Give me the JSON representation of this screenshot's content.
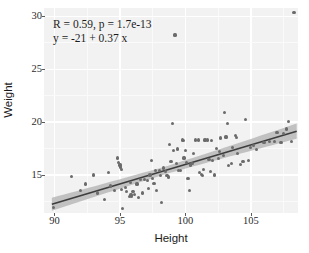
{
  "chart_data": {
    "type": "scatter",
    "title": "",
    "xlabel": "Height",
    "ylabel": "Weight",
    "xlim": [
      89.2,
      108.6
    ],
    "ylim": [
      11.4,
      30.8
    ],
    "xticks": [
      90,
      95,
      100,
      105
    ],
    "xticklabels": [
      "90",
      "95",
      "100",
      "105"
    ],
    "yticks": [
      15,
      20,
      25,
      30
    ],
    "yticklabels": [
      "15",
      "20",
      "25",
      "30"
    ],
    "grid": true,
    "legend": null,
    "annotations": {
      "line1": "R = 0.59,  p =  1.7e-13",
      "line2": "y = -21 + 0.37 x",
      "R": 0.59,
      "p": 1.7e-13,
      "intercept": -21,
      "slope": 0.37
    },
    "fit": {
      "type": "linear-regression",
      "intercept": -21,
      "slope": 0.37,
      "line_color": "#3d3d3d",
      "band_color": "#b4b4b4",
      "band_label": "95% confidence interval",
      "x_start": 89.8,
      "x_end": 108.5,
      "y_start": 12.23,
      "y_end": 19.15,
      "band_halfwidth_start": 0.62,
      "band_halfwidth_mid": 0.26,
      "band_halfwidth_end": 0.72
    },
    "point_color": "#6b6b6b",
    "panel_color": "#f2f2f2",
    "points": [
      [
        89.9,
        11.9
      ],
      [
        91.3,
        14.85
      ],
      [
        92.0,
        13.55
      ],
      [
        92.4,
        14.15
      ],
      [
        93.0,
        15.0
      ],
      [
        93.3,
        13.3
      ],
      [
        93.8,
        12.65
      ],
      [
        94.1,
        15.25
      ],
      [
        94.3,
        13.95
      ],
      [
        94.6,
        13.5
      ],
      [
        94.8,
        16.6
      ],
      [
        94.9,
        16.2
      ],
      [
        95.0,
        15.95
      ],
      [
        95.05,
        15.75
      ],
      [
        95.1,
        15.55
      ],
      [
        95.15,
        13.6
      ],
      [
        95.2,
        11.85
      ],
      [
        95.4,
        13.85
      ],
      [
        95.5,
        13.45
      ],
      [
        95.7,
        12.95
      ],
      [
        95.8,
        14.3
      ],
      [
        95.85,
        13.1
      ],
      [
        95.9,
        12.95
      ],
      [
        96.0,
        13.45
      ],
      [
        96.1,
        13.15
      ],
      [
        96.3,
        14.15
      ],
      [
        96.4,
        12.9
      ],
      [
        96.6,
        14.55
      ],
      [
        96.7,
        13.3
      ],
      [
        96.9,
        14.6
      ],
      [
        97.1,
        14.5
      ],
      [
        97.2,
        13.75
      ],
      [
        97.3,
        15.0
      ],
      [
        97.4,
        16.35
      ],
      [
        97.5,
        14.7
      ],
      [
        97.6,
        14.2
      ],
      [
        97.7,
        15.45
      ],
      [
        97.8,
        13.5
      ],
      [
        98.0,
        15.45
      ],
      [
        98.1,
        14.95
      ],
      [
        98.2,
        12.4
      ],
      [
        98.3,
        15.65
      ],
      [
        98.5,
        15.3
      ],
      [
        98.6,
        14.95
      ],
      [
        98.7,
        14.8
      ],
      [
        98.8,
        17.9
      ],
      [
        98.9,
        16.25
      ],
      [
        99.0,
        19.9
      ],
      [
        99.1,
        17.3
      ],
      [
        99.2,
        28.25
      ],
      [
        99.3,
        16.1
      ],
      [
        99.4,
        17.45
      ],
      [
        99.5,
        15.4
      ],
      [
        99.6,
        15.45
      ],
      [
        99.8,
        18.3
      ],
      [
        99.85,
        18.25
      ],
      [
        99.9,
        16.6
      ],
      [
        100.0,
        17.35
      ],
      [
        100.1,
        16.15
      ],
      [
        100.2,
        14.65
      ],
      [
        100.3,
        13.5
      ],
      [
        100.4,
        15.95
      ],
      [
        100.5,
        16.05
      ],
      [
        100.6,
        17.05
      ],
      [
        100.8,
        18.3
      ],
      [
        101.0,
        18.3
      ],
      [
        101.1,
        15.2
      ],
      [
        101.2,
        15.05
      ],
      [
        101.3,
        14.95
      ],
      [
        101.4,
        15.5
      ],
      [
        101.5,
        18.3
      ],
      [
        101.7,
        18.3
      ],
      [
        101.8,
        16.5
      ],
      [
        101.9,
        15.35
      ],
      [
        102.0,
        18.25
      ],
      [
        102.1,
        16.35
      ],
      [
        102.2,
        15.0
      ],
      [
        102.4,
        17.5
      ],
      [
        102.5,
        16.55
      ],
      [
        102.6,
        17.25
      ],
      [
        102.7,
        18.5
      ],
      [
        102.9,
        16.85
      ],
      [
        103.0,
        20.9
      ],
      [
        103.1,
        18.6
      ],
      [
        103.2,
        19.9
      ],
      [
        103.3,
        15.9
      ],
      [
        103.5,
        16.05
      ],
      [
        103.6,
        17.6
      ],
      [
        103.8,
        18.7
      ],
      [
        103.9,
        18.55
      ],
      [
        104.0,
        17.0
      ],
      [
        104.2,
        16.0
      ],
      [
        104.4,
        16.3
      ],
      [
        104.6,
        20.25
      ],
      [
        104.8,
        16.4
      ],
      [
        105.0,
        17.6
      ],
      [
        105.2,
        17.75
      ],
      [
        105.4,
        17.4
      ],
      [
        106.0,
        18.05
      ],
      [
        106.4,
        18.15
      ],
      [
        106.8,
        18.15
      ],
      [
        107.0,
        19.05
      ],
      [
        107.3,
        18.1
      ],
      [
        107.5,
        18.9
      ],
      [
        107.7,
        19.35
      ],
      [
        107.9,
        20.05
      ],
      [
        108.1,
        18.15
      ],
      [
        108.3,
        30.4
      ]
    ]
  }
}
